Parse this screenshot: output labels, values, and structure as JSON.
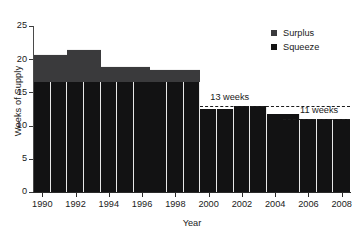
{
  "chart_data": {
    "type": "bar",
    "title": "",
    "xlabel": "Year",
    "ylabel": "Weeks of Supply",
    "ylim": [
      0,
      25
    ],
    "xlim": [
      1990,
      2009
    ],
    "grid": false,
    "stacked": true,
    "legend_position": "top-right",
    "yticks": [
      0,
      5,
      10,
      15,
      20,
      25
    ],
    "ytick_labels": [
      "0",
      "5",
      "10",
      "15",
      "20",
      "25"
    ],
    "xticks": [
      1990,
      1992,
      1994,
      1996,
      1998,
      2000,
      2002,
      2004,
      2006,
      2008
    ],
    "xtick_labels": [
      "1990",
      "1992",
      "1994",
      "1996",
      "1998",
      "2000",
      "2002",
      "2004",
      "2006",
      "2008"
    ],
    "categories": [
      1990,
      1991,
      1992,
      1993,
      1994,
      1995,
      1996,
      1997,
      1998,
      1999,
      2000,
      2001,
      2002,
      2003,
      2004,
      2005,
      2006,
      2007,
      2008
    ],
    "series": [
      {
        "name": "Squeeze",
        "color": "#121213",
        "values": [
          16.5,
          16.5,
          16.5,
          16.5,
          16.5,
          16.5,
          16.5,
          16.5,
          16.5,
          16.5,
          12.5,
          12.5,
          13.0,
          13.0,
          11.8,
          11.8,
          11.0,
          11.0,
          11.0
        ]
      },
      {
        "name": "Surplus",
        "color": "#3a3a3c",
        "values": [
          4.3,
          4.3,
          5.0,
          5.0,
          2.5,
          2.5,
          2.5,
          2.0,
          2.0,
          2.0,
          0.0,
          0.0,
          0.0,
          0.0,
          0.0,
          0.0,
          0.0,
          0.0,
          0.0
        ]
      }
    ],
    "totals": [
      20.8,
      20.8,
      21.5,
      21.5,
      19.0,
      19.0,
      19.0,
      18.5,
      18.5,
      18.5,
      12.5,
      12.5,
      13.0,
      13.0,
      11.8,
      11.8,
      11.0,
      11.0,
      11.0
    ],
    "annotations": [
      {
        "label": "13 weeks",
        "value": 13.0,
        "x_start": 2000,
        "x_end": 2009
      },
      {
        "label": "11 weeks",
        "value": 11.0,
        "x_start": 2005,
        "x_end": 2009
      }
    ]
  },
  "legend": {
    "items": [
      {
        "label": "Surplus",
        "color": "#3a3a3c"
      },
      {
        "label": "Squeeze",
        "color": "#121213"
      }
    ]
  }
}
